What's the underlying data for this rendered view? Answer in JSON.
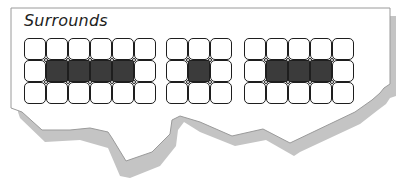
{
  "title": "Surrounds",
  "colors": {
    "paper": "#ffffff",
    "paper_border": "#9a9a9a",
    "shadow": "#c4c4c4",
    "cell_border": "#1e1e1e",
    "cell_dark": "#3b3b3b"
  },
  "grids": [
    {
      "name": "grid-six-by-three",
      "left": 24,
      "top": 38,
      "cols": 6,
      "rows": 3,
      "highlighted_row": 1,
      "highlighted_cols": [
        1,
        2,
        3,
        4
      ]
    },
    {
      "name": "grid-three-by-three",
      "left": 166,
      "top": 38,
      "cols": 3,
      "rows": 3,
      "highlighted_row": 1,
      "highlighted_cols": [
        1
      ]
    },
    {
      "name": "grid-five-by-three",
      "left": 244,
      "top": 38,
      "cols": 5,
      "rows": 3,
      "highlighted_row": 1,
      "highlighted_cols": [
        1,
        2,
        3
      ]
    }
  ],
  "cell_size": 22
}
